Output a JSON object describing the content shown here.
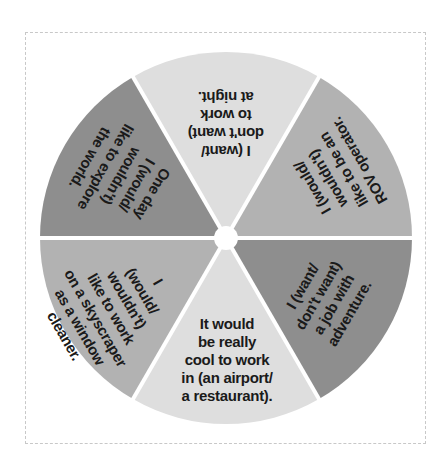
{
  "wheel": {
    "center": [
      226,
      238
    ],
    "radius": 186,
    "hub_radius": 12,
    "colors": {
      "light": "#dedede",
      "medium": "#b2b2b2",
      "dark": "#8e8e8e",
      "divider": "#ffffff",
      "frame": "#c8c8c8"
    },
    "slices": [
      {
        "id": "top",
        "color": "light",
        "lines": [
          "I (want/",
          "don't want)",
          "to work",
          "at night."
        ]
      },
      {
        "id": "upper-right",
        "color": "medium",
        "lines": [
          "I (would/",
          "wouldn't)",
          "like to be an",
          "ROV operator."
        ]
      },
      {
        "id": "lower-right",
        "color": "dark",
        "lines": [
          "I (want/",
          "don't want)",
          "a job with",
          "adventure."
        ]
      },
      {
        "id": "bottom",
        "color": "light",
        "lines": [
          "It would",
          "be really",
          "cool to work",
          "in (an airport/",
          "a restaurant)."
        ]
      },
      {
        "id": "lower-left",
        "color": "medium",
        "lines": [
          "I",
          "(would/",
          "wouldn't)",
          "like to work",
          "on a skyscraper",
          "as a window",
          "cleaner."
        ]
      },
      {
        "id": "upper-left",
        "color": "dark",
        "lines": [
          "One day",
          "I (would/",
          "wouldn't)",
          "like to explore",
          "the world."
        ]
      }
    ]
  }
}
